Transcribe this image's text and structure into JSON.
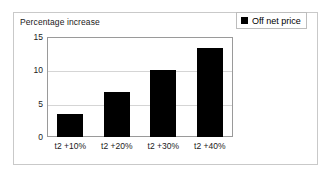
{
  "figure": {
    "background_color": "#ffffff",
    "panel_border_color": "#c9c9c9",
    "bar_color": "#000000",
    "gridline_color": "#d5d5d5",
    "axis_color": "#9a9a9a"
  },
  "legend": {
    "marker_icon": "black-square-icon",
    "entries": [
      {
        "label": "Off net price",
        "color": "#000000"
      }
    ]
  },
  "chart_data": {
    "type": "bar",
    "title": "",
    "subtitle": "",
    "xlabel": "",
    "ylabel": "Percentage increase",
    "categories": [
      "t2 +10%",
      "t2 +20%",
      "t2 +30%",
      "t2 +40%"
    ],
    "values": [
      3.4,
      6.7,
      10.0,
      13.3
    ],
    "series": [
      {
        "name": "Off net price",
        "color": "#000000",
        "values": [
          3.4,
          6.7,
          10.0,
          13.3
        ]
      }
    ],
    "ylim": [
      0,
      15
    ],
    "yticks": [
      0,
      5,
      10,
      15
    ],
    "ytick_labels": [
      "0",
      "5",
      "10",
      "15"
    ],
    "grid": true,
    "grid_axis": "y",
    "legend_position": "top-right"
  }
}
